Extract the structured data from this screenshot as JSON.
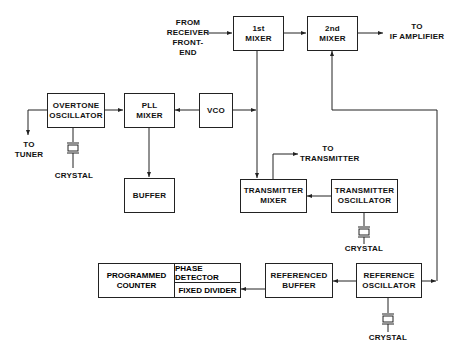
{
  "blocks": {
    "mixer1": [
      "1st",
      "MIXER"
    ],
    "mixer2": [
      "2nd",
      "MIXER"
    ],
    "overtone": [
      "OVERTONE",
      "OSCILLATOR"
    ],
    "pll": [
      "PLL",
      "MIXER"
    ],
    "vco": [
      "VCO"
    ],
    "buffer": [
      "BUFFER"
    ],
    "tx_mixer": [
      "TRANSMITTER",
      "MIXER"
    ],
    "tx_osc": [
      "TRANSMITTER",
      "OSCILLATOR"
    ],
    "prog_counter": [
      "PROGRAMMED",
      "COUNTER"
    ],
    "phase_detector": "PHASE DETECTOR",
    "fixed_divider": "FIXED DIVIDER",
    "ref_buffer": [
      "REFERENCED",
      "BUFFER"
    ],
    "ref_osc": [
      "REFERENCE",
      "OSCILLATOR"
    ]
  },
  "labels": {
    "from_receiver": [
      "FROM",
      "RECEIVER",
      "FRONT-END"
    ],
    "to_if": [
      "TO",
      "IF AMPLIFIER"
    ],
    "to_tuner": [
      "TO",
      "TUNER"
    ],
    "to_transmitter": [
      "TO",
      "TRANSMITTER"
    ],
    "crystal": "CRYSTAL"
  }
}
